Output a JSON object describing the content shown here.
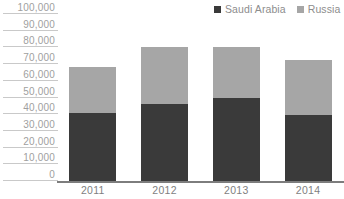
{
  "chart_data": {
    "type": "bar",
    "subtype": "stacked-bar",
    "title": "",
    "xlabel": "",
    "ylabel": "",
    "categories": [
      "2011",
      "2012",
      "2013",
      "2014"
    ],
    "series": [
      {
        "name": "Saudi Arabia",
        "color": "#3a3a3a",
        "values": [
          40500,
          46000,
          49500,
          39500
        ]
      },
      {
        "name": "Russia",
        "color": "#a6a6a6",
        "values": [
          28000,
          34000,
          30500,
          33000
        ]
      }
    ],
    "totals": [
      68500,
      80000,
      80000,
      72500
    ],
    "ylim": [
      0,
      100000
    ],
    "ytick_step": 10000,
    "ytick_labels": [
      "100,000",
      "90,000",
      "80,000",
      "70,000",
      "60,000",
      "50,000",
      "40,000",
      "30,000",
      "20,000",
      "10,000",
      "0"
    ],
    "ytick_values": [
      100000,
      90000,
      80000,
      70000,
      60000,
      50000,
      40000,
      30000,
      20000,
      10000,
      0
    ],
    "grid": false,
    "tick_marks": true,
    "legend": {
      "position": "top-right",
      "entries": [
        {
          "label": "Saudi Arabia",
          "color": "#3a3a3a",
          "swatch": "square-swatch-icon"
        },
        {
          "label": "Russia",
          "color": "#a6a6a6",
          "swatch": "square-swatch-icon"
        }
      ]
    }
  },
  "colors": {
    "axis": "#7d7d7d",
    "tick_rule": "#c9c9c9",
    "tick_text": "#a0a0a0",
    "category_text": "#7f7f7f",
    "legend_text": "#8d8d8d",
    "background": "#ffffff"
  }
}
